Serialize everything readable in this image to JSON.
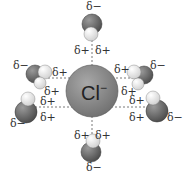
{
  "diagram": {
    "ion": {
      "label": "Cl",
      "charge": "−",
      "cx": 92,
      "cy": 91,
      "r": 26,
      "color": "#8c8c8c"
    },
    "colors": {
      "oxygen": "#6e6e6e",
      "hydrogen": "#e8e8e8",
      "dash": "#555555",
      "text": "#333333"
    },
    "labels": {
      "delta_minus": "δ−",
      "delta_plus": "δ+"
    },
    "waters": [
      {
        "id": "top",
        "o": [
          92,
          24,
          10
        ],
        "h": [
          [
            91,
            34,
            7
          ]
        ],
        "dm": [
          86,
          1
        ],
        "dp": [
          [
            74,
            45
          ],
          [
            95,
            45
          ]
        ]
      },
      {
        "id": "upper-left",
        "o": [
          35,
          74,
          9
        ],
        "h": [
          [
            45,
            72,
            7
          ],
          [
            40,
            83,
            6
          ]
        ],
        "dm": [
          13,
          60
        ],
        "dp": [
          [
            52,
            67
          ],
          [
            44,
            86
          ]
        ]
      },
      {
        "id": "lower-left",
        "o": [
          26,
          112,
          11
        ],
        "h": [
          [
            28,
            99,
            7
          ]
        ],
        "dm": [
          10,
          118
        ],
        "dp": [
          [
            40,
            96
          ],
          [
            40,
            112
          ]
        ]
      },
      {
        "id": "upper-right",
        "o": [
          144,
          75,
          9
        ],
        "h": [
          [
            134,
            72,
            7
          ],
          [
            138,
            84,
            6
          ]
        ],
        "dm": [
          150,
          60
        ],
        "dp": [
          [
            114,
            64
          ],
          [
            121,
            86
          ]
        ]
      },
      {
        "id": "lower-right",
        "o": [
          157,
          111,
          11
        ],
        "h": [
          [
            153,
            98,
            7
          ]
        ],
        "dm": [
          167,
          112
        ],
        "dp": [
          [
            129,
            95
          ],
          [
            129,
            112
          ]
        ]
      },
      {
        "id": "bottom",
        "o": [
          91,
          152,
          10
        ],
        "h": [
          [
            93,
            141,
            7
          ]
        ],
        "dm": [
          86,
          162
        ],
        "dp": [
          [
            74,
            130
          ],
          [
            95,
            130
          ]
        ]
      }
    ]
  }
}
